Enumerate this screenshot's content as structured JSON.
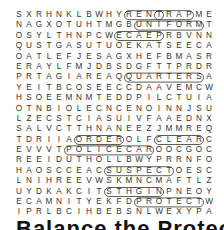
{
  "puzzle": {
    "type": "word-search",
    "rows": [
      "SXRHNKLBWHYRENTRAPME",
      "NAGXOTUHTMGBUNIFORMT",
      "OSYLTHNPCWECAEPRBVNN",
      "QUSTGASUTUOEKATSEECA",
      "OATLEFJESAGXHEFBMASR",
      "ERAYLFMJDBSDGFTTPRDR",
      "PRTAGIAREAQQUARTERSA",
      "YEITBCOSEECCDAAVEMCW",
      "HSOEEMNMTEDDPILCTUIA",
      "OTNBIOLECNCENOINNJSU",
      "LZECSTCIASUIVFAAEDNX",
      "SALVCTTHNANEEZJMMREQ",
      "TDRIIAORDEROLFCLEARC",
      "EVVVTPOLICECAROOCGOC",
      "REEIDUTHOLLBWYPRRNFO",
      "HAOSCCEACSUSPECTOESC",
      "LNIHREEVWSKMNCMAFTLZ",
      "UYDKAKCITSTHGINPNEOY",
      "ECAMNITYEKFDPROTECTW",
      "IPRLBCIHBEBSNLWEXYPA"
    ],
    "found_words": [
      "RENT",
      "TRAP",
      "UNIFORM",
      "ECAEP",
      "QUARTERS",
      "ORDER",
      "POLICE CAR",
      "CLEAR",
      "SUSPECT",
      "PROTECT",
      "STHGIN",
      "TICKETS"
    ],
    "circle_color": "#333333"
  },
  "heading": {
    "text": "Balance the Protect"
  }
}
